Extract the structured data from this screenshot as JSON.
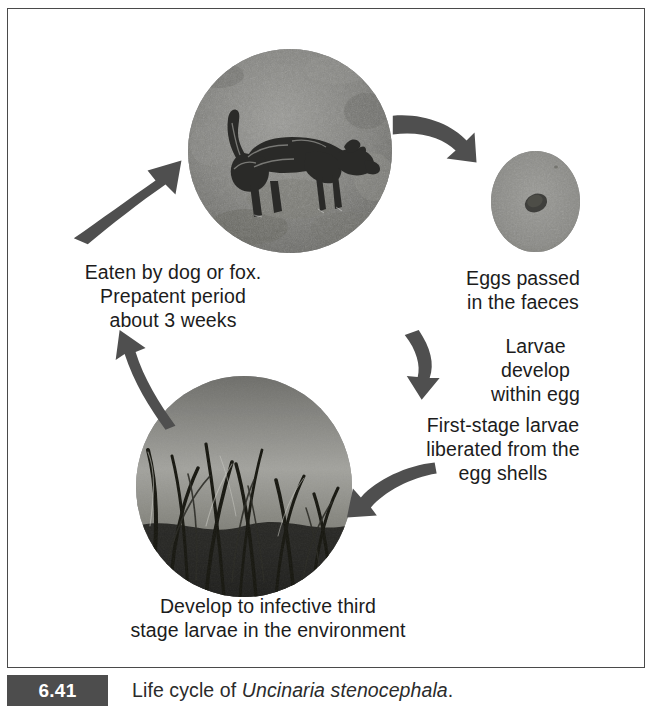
{
  "figure": {
    "caption_number": "6.41",
    "caption_text_prefix": "Life cycle of ",
    "caption_species": "Uncinaria stenocephala",
    "caption_text_suffix": ".",
    "accent_badge_color": "#4d4d4d",
    "frame_border_color": "#4a4a4a",
    "text_color": "#1c1c1c",
    "arrow_color": "#4f4f4f"
  },
  "diagram": {
    "type": "cycle",
    "title": "Life cycle of Uncinaria stenocephala",
    "stages": [
      {
        "id": "dog",
        "label": "Eaten by dog or fox.\nPrepatent period\nabout 3 weeks",
        "image": "photo-dog-walking-on-ground",
        "image_alt": "black and white photograph of a shaggy dog walking across gravelly ground"
      },
      {
        "id": "eggs",
        "label": "Eggs passed\nin the faeces",
        "image": "photo-hookworm-egg-microscopy",
        "image_alt": "grey microscope field showing a single dark oval hookworm egg"
      },
      {
        "id": "larvae-develop",
        "label": "Larvae\ndevelop\nwithin egg",
        "image": null,
        "image_alt": null
      },
      {
        "id": "first-stage-larvae",
        "label": "First-stage larvae\nliberated from the\negg shells",
        "image": null,
        "image_alt": null
      },
      {
        "id": "infective-larvae",
        "label": "Develop to infective third\nstage larvae in the environment",
        "image": "photo-grass-pasture",
        "image_alt": "black and white photograph looking up through tall blades of grass against the sky"
      }
    ],
    "arrows": [
      {
        "id": "arrow-dog-to-eggs",
        "from": "dog",
        "to": "eggs",
        "direction": "down-right"
      },
      {
        "id": "arrow-eggs-to-larvae",
        "from": "eggs",
        "to": "larvae-develop",
        "direction": "down"
      },
      {
        "id": "arrow-larvae-to-grass",
        "from": "first-stage-larvae",
        "to": "infective-larvae",
        "direction": "down-left"
      },
      {
        "id": "arrow-grass-to-text",
        "from": "infective-larvae",
        "to": "dog-text",
        "direction": "up"
      },
      {
        "id": "arrow-text-to-dog",
        "from": "dog-text",
        "to": "dog",
        "direction": "up-right"
      }
    ]
  }
}
